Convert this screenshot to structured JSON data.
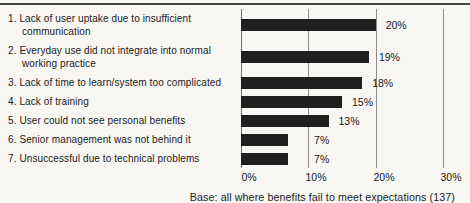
{
  "chart_data": {
    "type": "bar",
    "orientation": "horizontal",
    "title": "",
    "xlabel": "",
    "ylabel": "",
    "categories": [
      "1. Lack of user uptake due to insufficient communication",
      "2. Everyday use did not integrate into normal working practice",
      "3. Lack of time to learn/system too complicated",
      "4. Lack of training",
      "5. User could not see personal benefits",
      "6. Senior management was not behind it",
      "7. Unsuccessful due to technical problems"
    ],
    "values": [
      20,
      19,
      18,
      15,
      13,
      7,
      7
    ],
    "value_labels": [
      "20%",
      "19%",
      "18%",
      "15%",
      "13%",
      "7%",
      "7%"
    ],
    "xlim": [
      0,
      30
    ],
    "tick_values": [
      0,
      10,
      20,
      30
    ],
    "tick_labels": [
      "0%",
      "10%",
      "20%",
      "30%"
    ],
    "grid": "vertical gridlines at each tick",
    "legend": "none",
    "note": "Base: all where benefits fail to meet expectations (137)",
    "colors": {
      "bar": "#1f1f1f",
      "gridline": "#8d8d8d",
      "top_rule": "#474747",
      "text": "#1a1a1a",
      "background": "#f8f7f4"
    }
  }
}
